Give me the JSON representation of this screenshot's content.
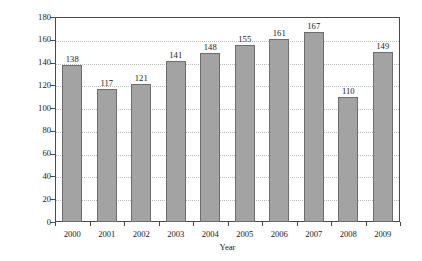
{
  "chart_data": {
    "type": "bar",
    "title": "",
    "subtitle": "",
    "xlabel": "Year",
    "ylabel": "% of assets under management",
    "categories": [
      "2000",
      "2001",
      "2002",
      "2003",
      "2004",
      "2005",
      "2006",
      "2007",
      "2008",
      "2009"
    ],
    "values": [
      138,
      117,
      121,
      141,
      148,
      155,
      161,
      167,
      110,
      149
    ],
    "data_labels": [
      "138",
      "117",
      "121",
      "141",
      "148",
      "155",
      "161",
      "167",
      "110",
      "149"
    ],
    "ylim": [
      0,
      180
    ],
    "ytick_values": [
      180,
      160,
      140,
      120,
      100,
      80,
      60,
      40,
      20,
      0
    ],
    "ytick_labels": [
      "180",
      "160",
      "140",
      "120",
      "100",
      "80",
      "60",
      "40",
      "20",
      "0"
    ],
    "xlim_categories": 10,
    "grid": {
      "horizontal": true,
      "vertical": false,
      "style": "dotted",
      "color": "#bdbdbd"
    },
    "legend": {
      "visible": false,
      "position": "none",
      "entries": []
    },
    "series": [
      {
        "name": "% of assets under management",
        "values": [
          138,
          117,
          121,
          141,
          148,
          155,
          161,
          167,
          110,
          149
        ]
      }
    ],
    "colors": {
      "bar_fill": "#a3a3a3",
      "bar_border": "#6d6d6d",
      "axis": "#4a4a4a",
      "grid": "#bdbdbd",
      "text": "#1a1a1a",
      "background": "#ffffff"
    }
  }
}
